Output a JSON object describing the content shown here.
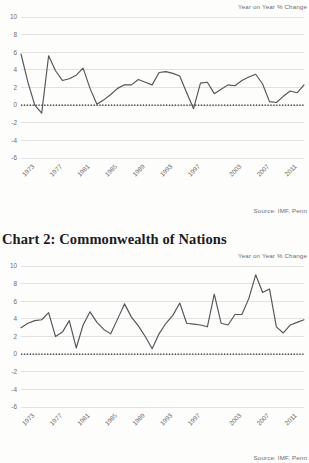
{
  "page": {
    "background": "#fdfdfc",
    "line_color": "#54545a",
    "grid_color": "#cfcfcf",
    "zero_line_color": "#2b2b2b",
    "text_color": "#6d6d6d"
  },
  "charts": [
    {
      "id": "chart-1",
      "title": "",
      "axis_note": "Year on Year % Change",
      "source_note": "Source: IMF, Penn"
    },
    {
      "id": "chart-2",
      "title": "Chart 2: Commonwealth of Nations",
      "axis_note": "Year on Year % Change",
      "source_note": "Source: IMF, Penn"
    }
  ],
  "chart_data": [
    {
      "type": "line",
      "title": "",
      "subtitle": "",
      "xlabel": "",
      "ylabel": "Year on Year % Change",
      "ylim": [
        -6,
        10
      ],
      "yticks": [
        10,
        8,
        6,
        4,
        2,
        0,
        -2,
        -4,
        -6
      ],
      "ytick_labels": [
        "10",
        "8",
        "6",
        "4",
        "2",
        "0",
        "-2",
        "-4",
        "-6"
      ],
      "xlim": [
        1971,
        2012
      ],
      "xticks": [
        1973,
        1977,
        1981,
        1985,
        1989,
        1993,
        1997,
        2003,
        2007,
        2011
      ],
      "xtick_labels": [
        "1973",
        "1977",
        "1981",
        "1985",
        "1989",
        "1993",
        "1997",
        "2003",
        "2007",
        "2011"
      ],
      "grid": true,
      "zero_reference_line": true,
      "legend": "none",
      "annotations": [
        "Year on Year % Change",
        "Source: IMF, Penn"
      ],
      "series": [
        {
          "name": "World GDP per capita growth",
          "x": [
            1971,
            1972,
            1973,
            1974,
            1975,
            1976,
            1977,
            1978,
            1979,
            1980,
            1981,
            1982,
            1983,
            1984,
            1985,
            1986,
            1987,
            1988,
            1989,
            1990,
            1991,
            1992,
            1993,
            1994,
            1995,
            1996,
            1997,
            1998,
            1999,
            2000,
            2001,
            2002,
            2003,
            2004,
            2005,
            2006,
            2007,
            2008,
            2009,
            2010,
            2011,
            2012
          ],
          "values": [
            5.8,
            2.6,
            0.0,
            -0.9,
            5.6,
            3.9,
            2.8,
            3.0,
            3.4,
            4.2,
            1.9,
            0.1,
            0.6,
            1.2,
            1.9,
            2.3,
            2.3,
            2.9,
            2.6,
            2.3,
            3.7,
            3.8,
            3.6,
            3.3,
            1.4,
            -0.4,
            2.5,
            2.6,
            1.3,
            1.8,
            2.3,
            2.2,
            2.8,
            3.2,
            3.5,
            2.4,
            0.4,
            0.3,
            1.0,
            1.6,
            1.4,
            2.3
          ]
        }
      ]
    },
    {
      "type": "line",
      "title": "Chart 2: Commonwealth of Nations",
      "subtitle": "",
      "xlabel": "",
      "ylabel": "Year on Year % Change",
      "ylim": [
        -6,
        10
      ],
      "yticks": [
        10,
        8,
        6,
        4,
        2,
        0,
        -2,
        -4,
        -6
      ],
      "ytick_labels": [
        "10",
        "8",
        "6",
        "4",
        "2",
        "0",
        "-2",
        "-4",
        "-6"
      ],
      "xlim": [
        1971,
        2012
      ],
      "xticks": [
        1973,
        1977,
        1981,
        1985,
        1989,
        1993,
        1997,
        2003,
        2007,
        2011
      ],
      "xtick_labels": [
        "1973",
        "1977",
        "1981",
        "1985",
        "1989",
        "1993",
        "1997",
        "2003",
        "2007",
        "2011"
      ],
      "grid": true,
      "zero_reference_line": true,
      "legend": "none",
      "annotations": [
        "Year on Year % Change",
        "Source: IMF, Penn"
      ],
      "series": [
        {
          "name": "Commonwealth of Nations GDP per capita growth",
          "x": [
            1971,
            1972,
            1973,
            1974,
            1975,
            1976,
            1977,
            1978,
            1979,
            1980,
            1981,
            1982,
            1983,
            1984,
            1985,
            1986,
            1987,
            1988,
            1989,
            1990,
            1991,
            1992,
            1993,
            1994,
            1995,
            1996,
            1997,
            1998,
            1999,
            2000,
            2001,
            2002,
            2003,
            2004,
            2005,
            2006,
            2007,
            2008,
            2009,
            2010,
            2011,
            2012
          ],
          "values": [
            3.0,
            3.5,
            3.8,
            3.9,
            4.7,
            2.0,
            2.5,
            3.8,
            0.7,
            3.3,
            4.8,
            3.6,
            2.8,
            2.3,
            4.0,
            5.7,
            4.2,
            3.2,
            2.0,
            0.6,
            2.3,
            3.5,
            4.4,
            5.8,
            3.5,
            3.4,
            3.3,
            3.1,
            6.8,
            3.5,
            3.3,
            4.5,
            4.5,
            6.3,
            9.0,
            7.0,
            7.4,
            3.1,
            2.4,
            3.3,
            3.6,
            3.9
          ]
        }
      ]
    }
  ]
}
